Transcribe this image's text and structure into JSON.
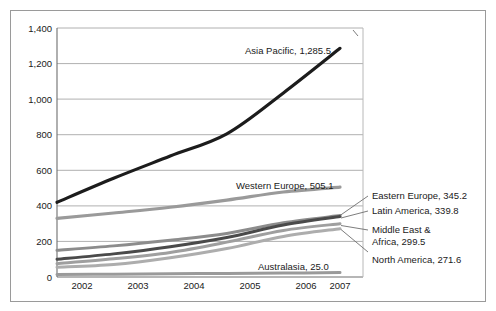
{
  "chart_data": {
    "type": "line",
    "title": "",
    "subtitle": "",
    "xlabel": "",
    "ylabel": "",
    "x": [
      "2002",
      "2003",
      "2004",
      "2005",
      "2006",
      "2007"
    ],
    "categories": [
      "2002",
      "2003",
      "2004",
      "2005",
      "2006",
      "2007"
    ],
    "xlim": [
      "2002",
      "2007"
    ],
    "ylim": [
      0,
      1400
    ],
    "ytick_labels": [
      "0",
      "200",
      "400",
      "600",
      "800",
      "1,000",
      "1,200",
      "1,400"
    ],
    "ytick_values": [
      0,
      200,
      400,
      600,
      800,
      1000,
      1200,
      1400
    ],
    "xtick_labels": [
      "2002",
      "2003",
      "2004",
      "2005",
      "2006",
      "2007"
    ],
    "grid": "horizontal",
    "legend_position": "inline-annotations",
    "series": [
      {
        "name": "Asia Pacific",
        "end_value_label": "1,285.5",
        "label_text": "Asia Pacific, 1,285.5",
        "color": "#1c1c1c",
        "width": 3.2,
        "values": [
          420,
          555,
          680,
          805,
          1035,
          1285.5
        ]
      },
      {
        "name": "Western Europe",
        "end_value_label": "505.1",
        "label_text": "Western Europe, 505.1",
        "color": "#9a9a9a",
        "width": 3.2,
        "values": [
          330,
          360,
          392,
          432,
          478,
          505.1
        ]
      },
      {
        "name": "Eastern Europe",
        "end_value_label": "345.2",
        "label_text": "Eastern Europe, 345.2",
        "color": "#8c8c8c",
        "width": 3.0,
        "values": [
          150,
          175,
          207,
          245,
          305,
          345.2
        ]
      },
      {
        "name": "Latin America",
        "end_value_label": "339.8",
        "label_text": "Latin America, 339.8",
        "color": "#4a4a4a",
        "width": 3.0,
        "values": [
          100,
          130,
          170,
          222,
          292,
          339.8
        ]
      },
      {
        "name": "Middle East & Africa",
        "end_value_label": "299.5",
        "label_text_line1": "Middle East &",
        "label_text_line2": "Africa, 299.5",
        "color": "#9f9f9f",
        "width": 3.0,
        "values": [
          75,
          102,
          138,
          196,
          262,
          299.5
        ]
      },
      {
        "name": "North America",
        "end_value_label": "271.6",
        "label_text": "North America, 271.6",
        "color": "#adadad",
        "width": 3.0,
        "values": [
          55,
          70,
          108,
          160,
          228,
          271.6
        ]
      },
      {
        "name": "Australasia",
        "end_value_label": "25.0",
        "label_text": "Australasia, 25.0",
        "color": "#9a9a9a",
        "width": 3.0,
        "values": [
          14,
          16,
          18,
          20,
          22,
          25.0
        ]
      }
    ],
    "annotations": [
      {
        "id": "asia-pacific",
        "text": "Asia Pacific, 1,285.5"
      },
      {
        "id": "western-europe",
        "text": "Western Europe, 505.1"
      },
      {
        "id": "australasia",
        "text": "Australasia, 25.0"
      },
      {
        "id": "eastern-europe",
        "text": "Eastern Europe, 345.2"
      },
      {
        "id": "latin-america",
        "text": "Latin America, 339.8"
      },
      {
        "id": "middle-east-africa-1",
        "text": "Middle East &"
      },
      {
        "id": "middle-east-africa-2",
        "text": "Africa, 299.5"
      },
      {
        "id": "north-america",
        "text": "North America, 271.6"
      }
    ]
  },
  "colors": {
    "background": "#ffffff",
    "frame": "#9a9a9a",
    "axis": "#6e6e6e",
    "gridline": "#b0b0b0",
    "text": "#1a1a1a"
  }
}
